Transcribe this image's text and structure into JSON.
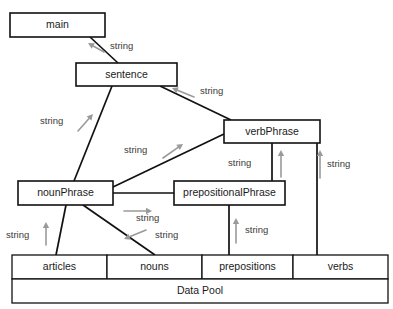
{
  "diagram": {
    "type": "dataflow-architecture-diagram",
    "nodes": [
      {
        "id": "main",
        "label": "main",
        "x": 10,
        "y": 13,
        "w": 95,
        "h": 24
      },
      {
        "id": "sentence",
        "label": "sentence",
        "x": 76,
        "y": 63,
        "w": 101,
        "h": 23
      },
      {
        "id": "verbPhrase",
        "label": "verbPhrase",
        "x": 224,
        "y": 120,
        "w": 96,
        "h": 23
      },
      {
        "id": "nounPhrase",
        "label": "nounPhrase",
        "x": 18,
        "y": 181,
        "w": 95,
        "h": 24
      },
      {
        "id": "prepositionalPhrase",
        "label": "prepositionalPhrase",
        "x": 174,
        "y": 181,
        "w": 111,
        "h": 24
      }
    ],
    "pool": {
      "label": "Data Pool",
      "x": 12,
      "y": 255,
      "w": 376,
      "h": 48,
      "row_height": 24,
      "cells": [
        {
          "id": "articles",
          "label": "articles",
          "x": 12,
          "w": 95
        },
        {
          "id": "nouns",
          "label": "nouns",
          "x": 107,
          "w": 95
        },
        {
          "id": "prepositions",
          "label": "prepositions",
          "x": 202,
          "w": 91
        },
        {
          "id": "verbs",
          "label": "verbs",
          "x": 293,
          "w": 95
        }
      ]
    },
    "connectors": [
      {
        "from": "main",
        "to": "sentence",
        "path": "M 90,37 L 118,63"
      },
      {
        "from": "sentence",
        "to": "verbPhrase",
        "path": "M 160,86 L 231,120"
      },
      {
        "from": "sentence",
        "to": "nounPhrase",
        "path": "M 112,86 L 74,181"
      },
      {
        "from": "nounPhrase",
        "to": "verbPhrase",
        "path": "M 113,187 L 224,134"
      },
      {
        "from": "nounPhrase",
        "to": "prepositionalPhrase",
        "path": "M 113,193 L 174,193"
      },
      {
        "from": "verbPhrase",
        "to": "prepositionalPhrase",
        "path": "M 272,143 L 272,181"
      },
      {
        "from": "verbPhrase",
        "to": "verbs",
        "path": "M 317,143 L 317,255"
      },
      {
        "from": "prepositionalPhrase",
        "to": "prepositions",
        "path": "M 229,205 L 229,255"
      },
      {
        "from": "nounPhrase",
        "to": "articles",
        "path": "M 66,205 L 56,255"
      },
      {
        "from": "nounPhrase",
        "to": "nouns",
        "path": "M 83,205 L 155,255"
      }
    ],
    "edge_labels": [
      {
        "text": "string",
        "x": 110,
        "y": 46,
        "arrow": {
          "x1": 104,
          "y1": 52,
          "x2": 88,
          "y2": 43
        }
      },
      {
        "text": "string",
        "x": 200,
        "y": 91,
        "arrow": {
          "x1": 194,
          "y1": 97,
          "x2": 172,
          "y2": 88
        }
      },
      {
        "text": "string",
        "x": 40,
        "y": 121,
        "arrow": {
          "x1": 78,
          "y1": 131,
          "x2": 93,
          "y2": 114
        }
      },
      {
        "text": "string",
        "x": 124,
        "y": 150,
        "arrow": {
          "x1": 163,
          "y1": 158,
          "x2": 183,
          "y2": 144
        }
      },
      {
        "text": "string",
        "x": 228,
        "y": 163,
        "arrow": {
          "x1": 281,
          "y1": 177,
          "x2": 281,
          "y2": 150
        }
      },
      {
        "text": "string",
        "x": 327,
        "y": 164,
        "arrow": {
          "x1": 320,
          "y1": 178,
          "x2": 320,
          "y2": 150
        }
      },
      {
        "text": "string",
        "x": 136,
        "y": 218,
        "arrow": {
          "x1": 124,
          "y1": 211,
          "x2": 152,
          "y2": 211
        }
      },
      {
        "text": "string",
        "x": 245,
        "y": 230,
        "arrow": {
          "x1": 236,
          "y1": 243,
          "x2": 236,
          "y2": 218
        }
      },
      {
        "text": "string",
        "x": 155,
        "y": 235,
        "arrow": {
          "x1": 146,
          "y1": 230,
          "x2": 124,
          "y2": 239
        }
      },
      {
        "text": "string",
        "x": 6,
        "y": 235,
        "arrow": {
          "x1": 46,
          "y1": 245,
          "x2": 46,
          "y2": 222
        }
      }
    ]
  },
  "page_artifacts": {
    "figure_mark": "",
    "bleed_text_top": "",
    "bleed_text_mid": ""
  }
}
